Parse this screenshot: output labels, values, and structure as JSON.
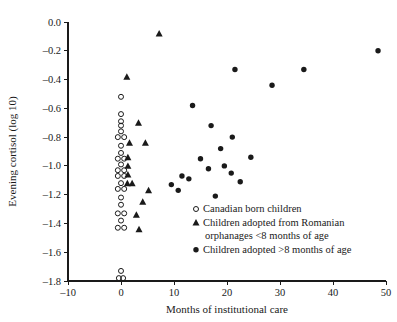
{
  "chart_data": {
    "type": "scatter",
    "title": "",
    "xlabel": "Months of institutional care",
    "ylabel": "Evening cortisol (log 10)",
    "xlim": [
      -10,
      50
    ],
    "ylim": [
      -1.8,
      0.0
    ],
    "xticks": [
      -10,
      0,
      10,
      20,
      30,
      40,
      50
    ],
    "xtick_labels": [
      "-10",
      "0",
      "10",
      "20",
      "30",
      "40",
      "50"
    ],
    "yticks": [
      0.0,
      -0.2,
      -0.4,
      -0.6,
      -0.8,
      -1.0,
      -1.2,
      -1.4,
      -1.6,
      -1.8
    ],
    "ytick_labels": [
      "0.0",
      "-0.2",
      "-0.4",
      "-0.6",
      "-0.8",
      "-1.0",
      "-1.2",
      "-1.4",
      "-1.6",
      "-1.8"
    ],
    "grid": false,
    "legend_position": "lower-right-inside",
    "marker_color": "#1a1a1a",
    "series": [
      {
        "name": "Canadian born children",
        "marker": "open-circle",
        "points": [
          [
            0.0,
            -0.52
          ],
          [
            0.0,
            -0.64
          ],
          [
            0.0,
            -0.69
          ],
          [
            0.0,
            -0.72
          ],
          [
            0.0,
            -0.76
          ],
          [
            -0.6,
            -0.8
          ],
          [
            0.6,
            -0.8
          ],
          [
            0.0,
            -0.86
          ],
          [
            0.0,
            -0.91
          ],
          [
            -0.6,
            -0.95
          ],
          [
            0.6,
            -0.95
          ],
          [
            0.0,
            -0.99
          ],
          [
            -0.6,
            -1.03
          ],
          [
            0.6,
            -1.03
          ],
          [
            -0.6,
            -1.07
          ],
          [
            0.6,
            -1.07
          ],
          [
            0.0,
            -1.12
          ],
          [
            -0.6,
            -1.16
          ],
          [
            0.6,
            -1.16
          ],
          [
            0.0,
            -1.22
          ],
          [
            0.0,
            -1.27
          ],
          [
            -0.6,
            -1.33
          ],
          [
            0.6,
            -1.33
          ],
          [
            0.0,
            -1.38
          ],
          [
            -0.6,
            -1.43
          ],
          [
            0.6,
            -1.43
          ],
          [
            0.0,
            -1.73
          ],
          [
            -0.4,
            -1.78
          ],
          [
            0.4,
            -1.78
          ]
        ]
      },
      {
        "name": "Children adopted from Romanian orphanages <8 months of age",
        "marker": "filled-triangle",
        "points": [
          [
            7.2,
            -0.08
          ],
          [
            1.1,
            -0.38
          ],
          [
            3.3,
            -0.7
          ],
          [
            1.6,
            -0.84
          ],
          [
            4.6,
            -0.84
          ],
          [
            1.3,
            -0.94
          ],
          [
            1.3,
            -1.0
          ],
          [
            1.3,
            -1.06
          ],
          [
            1.2,
            -1.12
          ],
          [
            2.1,
            -1.12
          ],
          [
            5.2,
            -1.17
          ],
          [
            4.1,
            -1.25
          ],
          [
            2.9,
            -1.34
          ],
          [
            3.4,
            -1.44
          ]
        ]
      },
      {
        "name": "Children adopted >8 months of age",
        "marker": "filled-circle",
        "points": [
          [
            48.5,
            -0.2
          ],
          [
            21.5,
            -0.33
          ],
          [
            28.5,
            -0.44
          ],
          [
            34.5,
            -0.33
          ],
          [
            13.5,
            -0.58
          ],
          [
            17.0,
            -0.72
          ],
          [
            21.0,
            -0.8
          ],
          [
            9.5,
            -1.13
          ],
          [
            11.5,
            -1.07
          ],
          [
            12.8,
            -1.09
          ],
          [
            15.0,
            -0.95
          ],
          [
            16.5,
            -1.02
          ],
          [
            18.8,
            -0.88
          ],
          [
            19.5,
            -1.0
          ],
          [
            20.8,
            -1.05
          ],
          [
            22.5,
            -1.11
          ],
          [
            24.5,
            -0.94
          ],
          [
            17.8,
            -1.21
          ],
          [
            10.8,
            -1.17
          ]
        ]
      }
    ]
  },
  "legend": {
    "items": [
      {
        "marker": "open-circle",
        "label": "Canadian born children"
      },
      {
        "marker": "filled-triangle",
        "label": "Children adopted from Romanian"
      },
      {
        "marker": "none",
        "label": "orphanages <8 months of age"
      },
      {
        "marker": "filled-circle",
        "label": "Children adopted >8 months of age"
      }
    ]
  }
}
